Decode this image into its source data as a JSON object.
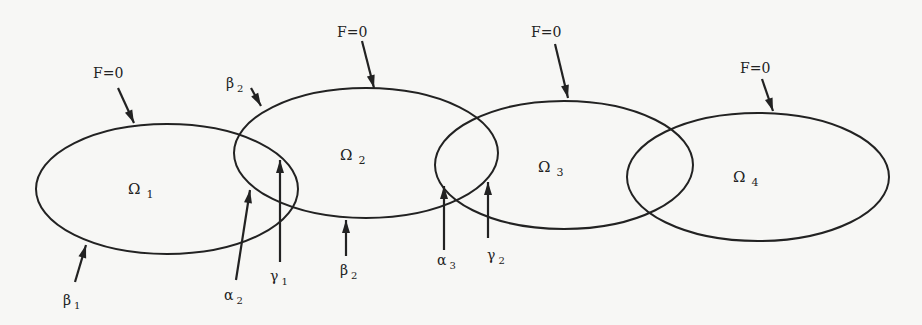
{
  "diagram": {
    "type": "overlapping-subdomains",
    "domains": [
      {
        "id": "omega1",
        "symbol": "Ω",
        "sub": "1",
        "cx": 167,
        "cy": 189,
        "rx": 131,
        "ry": 65,
        "lx": 128,
        "ly": 194
      },
      {
        "id": "omega2",
        "symbol": "Ω",
        "sub": "2",
        "cx": 366,
        "cy": 153,
        "rx": 132,
        "ry": 65,
        "lx": 340,
        "ly": 160
      },
      {
        "id": "omega3",
        "symbol": "Ω",
        "sub": "3",
        "cx": 564,
        "cy": 165,
        "rx": 129,
        "ry": 64,
        "lx": 538,
        "ly": 172
      },
      {
        "id": "omega4",
        "symbol": "Ω",
        "sub": "4",
        "cx": 758,
        "cy": 177,
        "rx": 131,
        "ry": 64,
        "lx": 733,
        "ly": 182
      }
    ],
    "labels": [
      {
        "id": "f0-1",
        "text": "F=0",
        "sub": "",
        "x": 93,
        "y": 78,
        "arrow": [
          118,
          88,
          134,
          123
        ]
      },
      {
        "id": "f0-2",
        "text": "F=0",
        "sub": "",
        "x": 337,
        "y": 37,
        "arrow": [
          362,
          41,
          374,
          88
        ]
      },
      {
        "id": "f0-3",
        "text": "F=0",
        "sub": "",
        "x": 531,
        "y": 37,
        "arrow": [
          555,
          44,
          568,
          98
        ]
      },
      {
        "id": "f0-4",
        "text": "F=0",
        "sub": "",
        "x": 740,
        "y": 73,
        "arrow": [
          762,
          79,
          773,
          111
        ]
      },
      {
        "id": "beta2-top",
        "text": "β",
        "sub": "2",
        "x": 226,
        "y": 88,
        "arrow": [
          251,
          88,
          261,
          106
        ]
      },
      {
        "id": "beta1",
        "text": "β",
        "sub": "1",
        "x": 63,
        "y": 305,
        "arrow": [
          75,
          282,
          86,
          245
        ]
      },
      {
        "id": "alpha2",
        "text": "α",
        "sub": "2",
        "x": 224,
        "y": 300,
        "arrow": [
          236,
          280,
          250,
          190
        ]
      },
      {
        "id": "gamma1",
        "text": "γ",
        "sub": "1",
        "x": 270,
        "y": 281,
        "arrow": [
          280,
          262,
          280,
          160
        ]
      },
      {
        "id": "beta2-bot",
        "text": "β",
        "sub": "2",
        "x": 340,
        "y": 275,
        "arrow": [
          346,
          256,
          346,
          220
        ]
      },
      {
        "id": "alpha3",
        "text": "α",
        "sub": "3",
        "x": 437,
        "y": 265,
        "arrow": [
          444,
          250,
          444,
          186
        ]
      },
      {
        "id": "gamma2",
        "text": "γ",
        "sub": "2",
        "x": 487,
        "y": 260,
        "arrow": [
          488,
          238,
          488,
          182
        ]
      }
    ]
  }
}
